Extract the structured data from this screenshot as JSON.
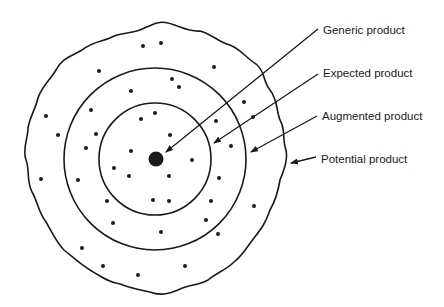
{
  "diagram": {
    "labels": [
      {
        "id": "generic",
        "text": "Generic product",
        "x": 323,
        "y": 24
      },
      {
        "id": "expected",
        "text": "Expected product",
        "x": 323,
        "y": 67
      },
      {
        "id": "augmented",
        "text": "Augmented product",
        "x": 322,
        "y": 110
      },
      {
        "id": "potential",
        "text": "Potential product",
        "x": 321,
        "y": 153
      }
    ],
    "colors": {
      "ink": "#1a1a1a",
      "background": "#ffffff"
    }
  }
}
